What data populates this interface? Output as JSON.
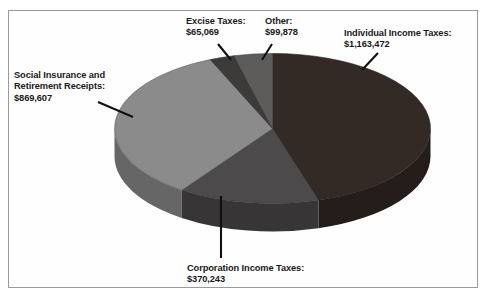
{
  "chart_data": {
    "type": "pie",
    "title": "",
    "subtitle": "",
    "xlabel": "",
    "ylabel": "",
    "legend_position": "none",
    "grid": false,
    "style": "3d-pie",
    "units": "millions of dollars",
    "total": 2568269,
    "categories": [
      "Individual Income Taxes",
      "Corporation Income Taxes",
      "Social Insurance and Retirement Receipts",
      "Excise Taxes",
      "Other"
    ],
    "values": [
      1163472,
      370243,
      869607,
      65069,
      99878
    ],
    "slices": [
      {
        "name": "Individual Income Taxes",
        "label": "Individual Income Taxes:",
        "amount": "$1,163,472",
        "value": 1163472,
        "percent": 45.3,
        "color": "#332a26",
        "side_color": "#241d1a",
        "start_deg": 0,
        "end_deg": 163.1
      },
      {
        "name": "Corporation Income Taxes",
        "label": "Corporation Income Taxes:",
        "amount": "$370,243",
        "value": 370243,
        "percent": 14.4,
        "color": "#4c4a4a",
        "side_color": "#373535",
        "start_deg": 163.1,
        "end_deg": 215.0
      },
      {
        "name": "Social Insurance and Retirement Receipts",
        "label": "Social Insurance and Retirement Receipts:",
        "amount": "$869,607",
        "value": 869607,
        "percent": 33.9,
        "color": "#8b8b8b",
        "side_color": "#666666",
        "start_deg": 215.0,
        "end_deg": 336.8
      },
      {
        "name": "Excise Taxes",
        "label": "Excise Taxes:",
        "amount": "$65,069",
        "value": 65069,
        "percent": 2.5,
        "color": "#3d3b39",
        "side_color": "#2c2a29",
        "start_deg": 336.8,
        "end_deg": 345.9
      },
      {
        "name": "Other",
        "label": "Other:",
        "amount": "$99,878",
        "value": 99878,
        "percent": 3.9,
        "color": "#5e5c5a",
        "side_color": "#454341",
        "start_deg": 345.9,
        "end_deg": 360.0
      }
    ]
  },
  "labels": {
    "individual": {
      "name": "Individual Income Taxes:",
      "amount": "$1,163,472"
    },
    "social": {
      "line1": "Social Insurance and",
      "line2": "Retirement Receipts:",
      "amount": "$869,607"
    },
    "excise": {
      "name": "Excise Taxes:",
      "amount": "$65,069"
    },
    "other": {
      "name": "Other:",
      "amount": "$99,878"
    },
    "corporation": {
      "name": "Corporation Income Taxes:",
      "amount": "$370,243"
    }
  }
}
